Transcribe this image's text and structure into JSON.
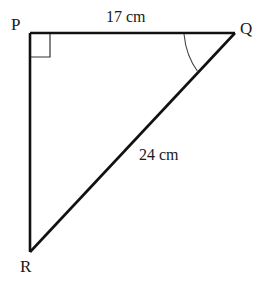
{
  "diagram": {
    "type": "right-triangle",
    "vertices": {
      "P": {
        "label": "P",
        "x": 30,
        "y": 33
      },
      "Q": {
        "label": "Q",
        "x": 235,
        "y": 33
      },
      "R": {
        "label": "R",
        "x": 30,
        "y": 252
      }
    },
    "sides": {
      "PQ": {
        "label": "17 cm"
      },
      "QR": {
        "label": "24 cm"
      },
      "PR": {
        "label": ""
      }
    },
    "markers": {
      "right_angle_at": "P",
      "angle_arc_at": "Q"
    },
    "colors": {
      "stroke": "#111111",
      "background": "#ffffff"
    }
  }
}
